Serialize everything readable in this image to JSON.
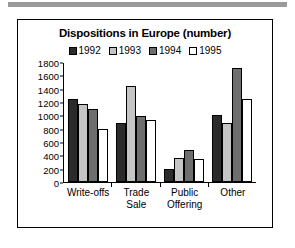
{
  "chart_data": {
    "type": "bar",
    "title": "Dispositions in Europe (number)",
    "xlabel": "",
    "ylabel": "",
    "ylim": [
      0,
      1800
    ],
    "ytick_step": 200,
    "yticks": [
      1800,
      1600,
      1400,
      1200,
      1000,
      800,
      600,
      400,
      200,
      0
    ],
    "grid": false,
    "legend_position": "top",
    "categories": [
      "Write-offs",
      "Trade Sale",
      "Public Offering",
      "Other"
    ],
    "category_lines": [
      [
        "Write-offs"
      ],
      [
        "Trade",
        "Sale"
      ],
      [
        "Public",
        "Offering"
      ],
      [
        "Other"
      ]
    ],
    "series": [
      {
        "name": "1992",
        "color": "#2b2b2b",
        "values": [
          1255,
          895,
          200,
          1015
        ]
      },
      {
        "name": "1993",
        "color": "#c4c4c4",
        "values": [
          1185,
          1455,
          365,
          900
        ]
      },
      {
        "name": "1994",
        "color": "#6e6e6e",
        "values": [
          1105,
          1000,
          485,
          1720
        ]
      },
      {
        "name": "1995",
        "color": "#ffffff",
        "values": [
          805,
          935,
          350,
          1250
        ]
      }
    ]
  },
  "legend": {
    "items": [
      {
        "label": "1992",
        "color": "#2b2b2b"
      },
      {
        "label": "1993",
        "color": "#c4c4c4"
      },
      {
        "label": "1994",
        "color": "#6e6e6e"
      },
      {
        "label": "1995",
        "color": "#ffffff"
      }
    ]
  }
}
